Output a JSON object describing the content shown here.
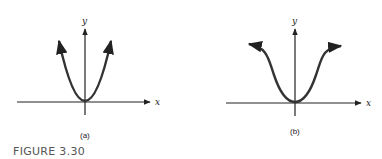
{
  "figure": {
    "caption": "FIGURE 3.30",
    "stroke_color": "#222222",
    "panels": [
      {
        "id": "a",
        "label": "(a)",
        "x_axis_label": "x",
        "y_axis_label": "y",
        "curve": "parabola"
      },
      {
        "id": "b",
        "label": "(b)",
        "x_axis_label": "x",
        "y_axis_label": "y",
        "curve": "inverted-bell"
      }
    ]
  }
}
